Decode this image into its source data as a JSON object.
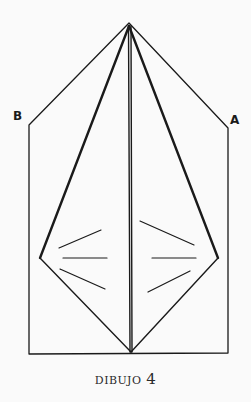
{
  "diagram": {
    "labels": {
      "left_corner": "B",
      "right_corner": "A"
    },
    "caption": {
      "word": "DIBUJO",
      "number": "4"
    },
    "colors": {
      "background": "#fafafa",
      "ink": "#1a1a1a"
    }
  }
}
